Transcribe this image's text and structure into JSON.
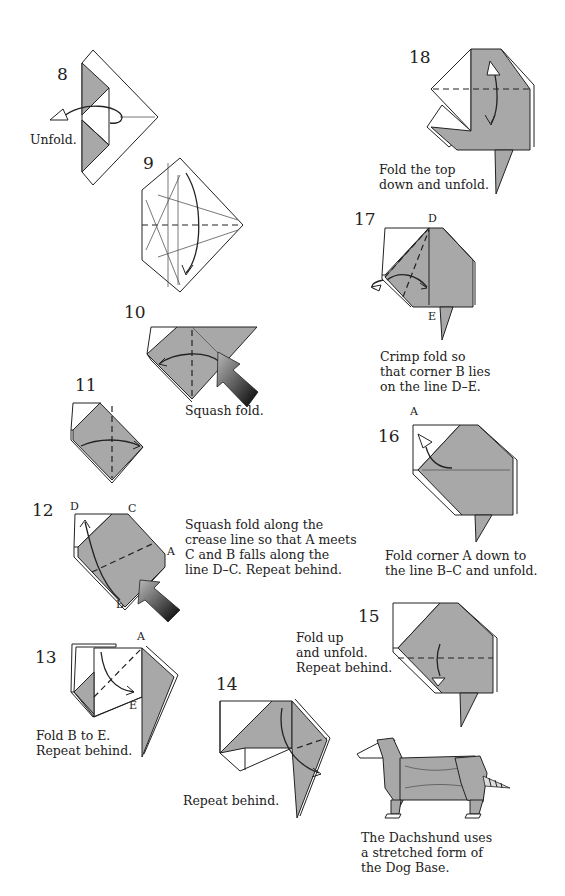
{
  "steps": [
    {
      "number": "8",
      "caption": "Unfold."
    },
    {
      "number": "9",
      "caption": ""
    },
    {
      "number": "10",
      "caption": "Squash fold."
    },
    {
      "number": "11",
      "caption": ""
    },
    {
      "number": "12",
      "caption": "Squash fold along the\ncrease line so that A meets\nC and B falls along the\nline D–C. Repeat behind.",
      "labels": {
        "d": "D",
        "c": "C",
        "a": "A",
        "b": "B"
      }
    },
    {
      "number": "13",
      "caption": "Fold B to E.\nRepeat behind.",
      "labels": {
        "a": "A",
        "b": "B",
        "e": "E"
      }
    },
    {
      "number": "14",
      "caption": "Repeat behind."
    },
    {
      "number": "15",
      "caption": "Fold up\nand unfold.\nRepeat behind."
    },
    {
      "number": "16",
      "caption": "Fold corner A down to\nthe line B–C and unfold.",
      "labels": {
        "a": "A",
        "b": "B",
        "c": "C"
      }
    },
    {
      "number": "17",
      "caption": "Crimp fold so\nthat corner B lies\non the line D–E.",
      "labels": {
        "d": "D",
        "b": "B",
        "e": "E"
      }
    },
    {
      "number": "18",
      "caption": "Fold the top\ndown and unfold."
    }
  ],
  "final": {
    "caption": "The Dachshund uses\na stretched form of\nthe Dog Base."
  },
  "colors": {
    "paper_gray": "#a8a8a8",
    "outline": "#222222",
    "background": "#ffffff"
  }
}
